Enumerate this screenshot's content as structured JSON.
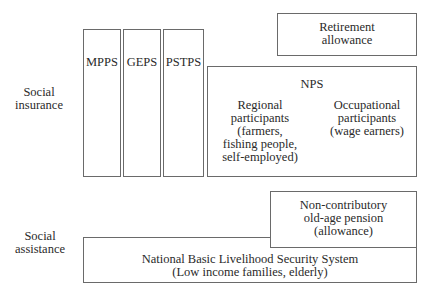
{
  "diagram": {
    "row_labels": {
      "social_insurance": [
        "Social",
        "insurance"
      ],
      "social_assistance": [
        "Social",
        "assistance"
      ]
    },
    "boxes": {
      "mpps": "MPPS",
      "geps": "GEPS",
      "pstps": "PSTPS",
      "retirement": [
        "Retirement",
        "allowance"
      ],
      "nps": {
        "title": "NPS",
        "regional": [
          "Regional",
          "participants",
          "(farmers,",
          "fishing people,",
          "self-employed)"
        ],
        "occupational": [
          "Occupational",
          "participants",
          "(wage earners)"
        ]
      },
      "non_contributory": [
        "Non-contributory",
        "old-age pension",
        "(allowance)"
      ],
      "nblss": [
        "National Basic Livelihood Security System",
        "(Low income families, elderly)"
      ]
    },
    "colors": {
      "border": "#6a6a6a",
      "text": "#2a2a2a",
      "background": "#ffffff"
    }
  }
}
